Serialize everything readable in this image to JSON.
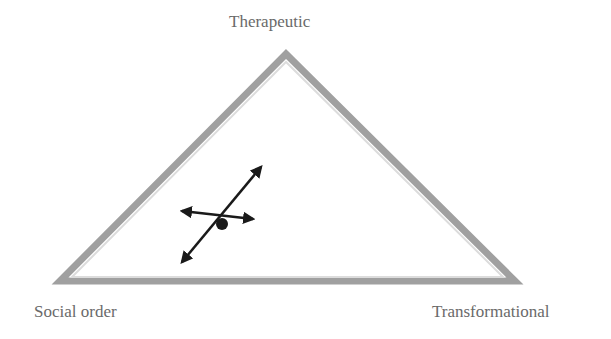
{
  "diagram": {
    "vertices": {
      "top": "Therapeutic",
      "bottom_left": "Social order",
      "bottom_right": "Transformational"
    },
    "colors": {
      "triangle_stroke": "#9a9a9a",
      "triangle_inner": "#d4d4d4",
      "arrows": "#1a1a1a",
      "label": "#6a6a6a"
    }
  }
}
